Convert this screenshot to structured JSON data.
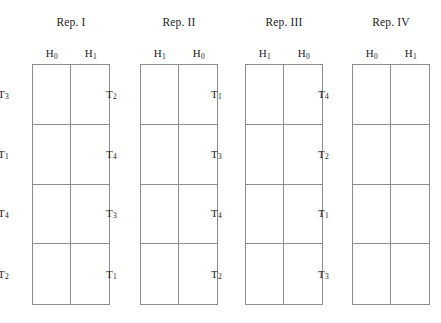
{
  "figure": {
    "type": "experimental-design-layout",
    "background_color": "#ffffff",
    "line_color": "#8c8c8c",
    "text_color": "#1a1a1a",
    "blocks": [
      {
        "title": "Rep. I",
        "left": 0,
        "columns": [
          {
            "letter": "H",
            "sub": "0"
          },
          {
            "letter": "H",
            "sub": "1"
          }
        ],
        "rows": [
          {
            "letter": "T",
            "sub": "3"
          },
          {
            "letter": "T",
            "sub": "1"
          },
          {
            "letter": "T",
            "sub": "4"
          },
          {
            "letter": "T",
            "sub": "2"
          }
        ]
      },
      {
        "title": "Rep. II",
        "left": 108,
        "columns": [
          {
            "letter": "H",
            "sub": "1"
          },
          {
            "letter": "H",
            "sub": "0"
          }
        ],
        "rows": [
          {
            "letter": "T",
            "sub": "2"
          },
          {
            "letter": "T",
            "sub": "4"
          },
          {
            "letter": "T",
            "sub": "3"
          },
          {
            "letter": "T",
            "sub": "1"
          }
        ]
      },
      {
        "title": "Rep. III",
        "left": 213,
        "columns": [
          {
            "letter": "H",
            "sub": "1"
          },
          {
            "letter": "H",
            "sub": "0"
          }
        ],
        "rows": [
          {
            "letter": "T",
            "sub": "1"
          },
          {
            "letter": "T",
            "sub": "3"
          },
          {
            "letter": "T",
            "sub": "4"
          },
          {
            "letter": "T",
            "sub": "2"
          }
        ]
      },
      {
        "title": "Rep. IV",
        "left": 320,
        "columns": [
          {
            "letter": "H",
            "sub": "0"
          },
          {
            "letter": "H",
            "sub": "1"
          }
        ],
        "rows": [
          {
            "letter": "T",
            "sub": "4"
          },
          {
            "letter": "T",
            "sub": "2"
          },
          {
            "letter": "T",
            "sub": "1"
          },
          {
            "letter": "T",
            "sub": "3"
          }
        ]
      }
    ]
  }
}
